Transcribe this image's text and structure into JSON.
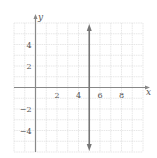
{
  "chart_data": {
    "type": "line",
    "title": "",
    "xlabel": "x",
    "ylabel": "y",
    "xlim": [
      -2,
      10
    ],
    "ylim": [
      -6,
      6
    ],
    "grid": true,
    "x_ticks": [
      2,
      4,
      6,
      8
    ],
    "y_ticks": [
      4,
      2,
      -2,
      -4
    ],
    "x_tick_labels": [
      "2",
      "4",
      "6",
      "8"
    ],
    "y_tick_labels": [
      "4",
      "2",
      "−2",
      "−4"
    ],
    "series": [
      {
        "name": "x = 5",
        "kind": "vertical-line",
        "x": [
          5,
          5
        ],
        "y": [
          -6,
          6
        ],
        "arrows": "both",
        "color": "#777777"
      }
    ]
  },
  "colors": {
    "grid": "#dcdcdc",
    "axis": "#888888",
    "line": "#7a7a7a"
  }
}
